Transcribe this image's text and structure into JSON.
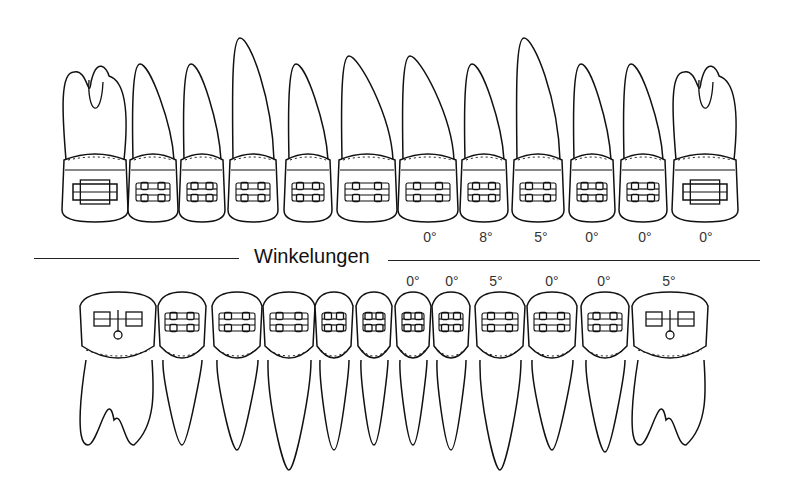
{
  "diagram": {
    "title": "Winkelungen",
    "stroke_color": "#111111",
    "upper_row": {
      "teeth": [
        {
          "x": 95,
          "w": 66,
          "type": "molar",
          "root_top": 72
        },
        {
          "x": 153,
          "w": 50,
          "type": "premolar",
          "root_top": 64
        },
        {
          "x": 202,
          "w": 46,
          "type": "premolar",
          "root_top": 64
        },
        {
          "x": 253,
          "w": 50,
          "type": "canine",
          "root_top": 38
        },
        {
          "x": 308,
          "w": 48,
          "type": "incisor",
          "root_top": 64
        },
        {
          "x": 367,
          "w": 60,
          "type": "incisor",
          "root_top": 56
        },
        {
          "x": 428,
          "w": 60,
          "type": "incisor",
          "root_top": 56
        },
        {
          "x": 484,
          "w": 48,
          "type": "incisor",
          "root_top": 64
        },
        {
          "x": 538,
          "w": 52,
          "type": "canine",
          "root_top": 38
        },
        {
          "x": 592,
          "w": 46,
          "type": "premolar",
          "root_top": 64
        },
        {
          "x": 643,
          "w": 48,
          "type": "premolar",
          "root_top": 64
        },
        {
          "x": 705,
          "w": 66,
          "type": "molar",
          "root_top": 72
        }
      ],
      "angulation_labels": [
        {
          "x": 430,
          "text": "0°"
        },
        {
          "x": 486,
          "text": "8°"
        },
        {
          "x": 541,
          "text": "5°"
        },
        {
          "x": 592,
          "text": "0°"
        },
        {
          "x": 645,
          "text": "0°"
        },
        {
          "x": 706,
          "text": "0°"
        }
      ]
    },
    "lower_row": {
      "teeth": [
        {
          "x": 118,
          "w": 76,
          "type": "molar",
          "root_bottom": 445
        },
        {
          "x": 182,
          "w": 48,
          "type": "premolar",
          "root_bottom": 445
        },
        {
          "x": 237,
          "w": 50,
          "type": "premolar",
          "root_bottom": 450
        },
        {
          "x": 289,
          "w": 52,
          "type": "canine",
          "root_bottom": 470
        },
        {
          "x": 334,
          "w": 38,
          "type": "incisor",
          "root_bottom": 450
        },
        {
          "x": 374,
          "w": 36,
          "type": "incisor",
          "root_bottom": 445
        },
        {
          "x": 413,
          "w": 36,
          "type": "incisor",
          "root_bottom": 445
        },
        {
          "x": 451,
          "w": 38,
          "type": "incisor",
          "root_bottom": 450
        },
        {
          "x": 500,
          "w": 50,
          "type": "canine",
          "root_bottom": 470
        },
        {
          "x": 552,
          "w": 50,
          "type": "premolar",
          "root_bottom": 450
        },
        {
          "x": 605,
          "w": 48,
          "type": "premolar",
          "root_bottom": 452
        },
        {
          "x": 670,
          "w": 76,
          "type": "molar",
          "root_bottom": 445
        }
      ],
      "angulation_labels": [
        {
          "x": 413,
          "text": "0°"
        },
        {
          "x": 452,
          "text": "0°"
        },
        {
          "x": 496,
          "text": "5°"
        },
        {
          "x": 552,
          "text": "0°"
        },
        {
          "x": 604,
          "text": "0°"
        },
        {
          "x": 669,
          "text": "5°"
        }
      ]
    }
  }
}
